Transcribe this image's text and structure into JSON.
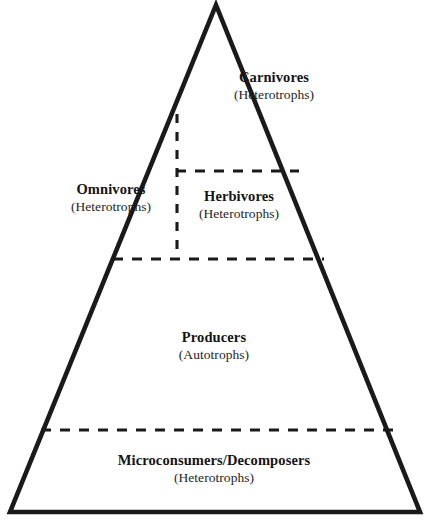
{
  "diagram": {
    "type": "ecological-pyramid",
    "shape": "triangle",
    "colors": {
      "outline": "#1a1a1a",
      "divider": "#1a1a1a",
      "background": "#ffffff",
      "text": "#141414"
    },
    "tiers": [
      {
        "id": "carnivores",
        "name": "Carnivores",
        "subtitle": "(Heterotrophs)"
      },
      {
        "id": "omnivores",
        "name": "Omnivores",
        "subtitle": "(Heterotrophs)"
      },
      {
        "id": "herbivores",
        "name": "Herbivores",
        "subtitle": "(Heterotrophs)"
      },
      {
        "id": "producers",
        "name": "Producers",
        "subtitle": "(Autotrophs)"
      },
      {
        "id": "decomposers",
        "name": "Microconsumers/Decomposers",
        "subtitle": "(Heterotrophs)"
      }
    ],
    "geometry": {
      "apex": [
        216,
        5
      ],
      "base_left": [
        10,
        512
      ],
      "base_right": [
        420,
        512
      ],
      "divider_herbivore_top": {
        "x1": 177,
        "y1": 171,
        "x2": 298,
        "y2": 171
      },
      "divider_vertical": {
        "x1": 177,
        "y1": 115,
        "x2": 177,
        "y2": 259
      },
      "divider_producers_top": {
        "x1": 114,
        "y1": 259,
        "x2": 323,
        "y2": 259
      },
      "divider_decomposers_top": {
        "x1": 42,
        "y1": 430,
        "x2": 392,
        "y2": 430
      }
    }
  }
}
